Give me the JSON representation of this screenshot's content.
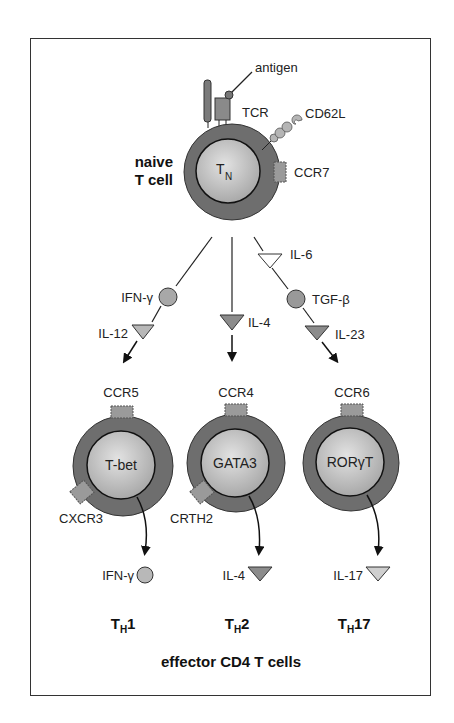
{
  "naive_cell": {
    "title_line1": "naive",
    "title_line2": "T cell",
    "core_label": "T",
    "core_sub": "N",
    "receptors": {
      "antigen": "antigen",
      "tcr": "TCR",
      "cd62l": "CD62L",
      "ccr7": "CCR7"
    }
  },
  "signals": {
    "th1": {
      "circle": "IFN-γ",
      "triangle": "IL-12"
    },
    "th2": {
      "triangle": "IL-4"
    },
    "th17": {
      "triangle_top": "IL-6",
      "circle": "TGF-β",
      "triangle": "IL-23"
    }
  },
  "effector_cells": [
    {
      "receptor_top": "CCR5",
      "core": "T-bet",
      "receptor_side": "CXCR3",
      "output": "IFN-γ",
      "name_main": "T",
      "name_sub": "H",
      "name_suffix": "1"
    },
    {
      "receptor_top": "CCR4",
      "core": "GATA3",
      "receptor_side": "CRTH2",
      "output": "IL-4",
      "name_main": "T",
      "name_sub": "H",
      "name_suffix": "2"
    },
    {
      "receptor_top": "CCR6",
      "core": "RORγT",
      "receptor_side": "",
      "output": "IL-17",
      "name_main": "T",
      "name_sub": "H",
      "name_suffix": "17"
    }
  ],
  "footer": {
    "caption": "effector CD4 T cells"
  },
  "colors": {
    "membrane": "#6e6e6e",
    "core": "#bdbdbd",
    "receptor": "#9a9a9a",
    "signal_circle": "#a8a8a8",
    "triangle_dark": "#8c8c8c",
    "triangle_light": "#cfcfcf"
  }
}
